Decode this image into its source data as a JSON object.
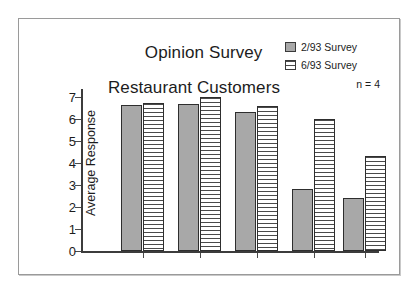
{
  "chart_data": {
    "type": "bar",
    "title": "Opinion Survey",
    "subtitle": "Restaurant Customers",
    "xlabel": "",
    "ylabel": "Average Response",
    "ylim": [
      0,
      7
    ],
    "yticks": [
      0,
      1,
      2,
      3,
      4,
      5,
      6,
      7
    ],
    "grid": false,
    "legend_position": "top-right",
    "annotation": "n = 4",
    "categories": [
      "Food",
      "Speed",
      "Friendly",
      "Servings",
      "Price"
    ],
    "series": [
      {
        "name": "2/93 Survey",
        "pattern": "stipple-gray",
        "color": "#a8a8a8",
        "values": [
          6.65,
          6.7,
          6.3,
          2.8,
          2.4
        ]
      },
      {
        "name": "6/93 Survey",
        "pattern": "horizontal-lines",
        "color": "#ffffff",
        "values": [
          6.75,
          7.0,
          6.6,
          6.0,
          4.3
        ]
      }
    ]
  },
  "chart": {
    "title_line1": "Opinion Survey",
    "title_line2": "Restaurant Customers",
    "y_axis_title": "Average Response",
    "sample_note": "n = 4",
    "y_tick_labels": [
      "7",
      "6",
      "5",
      "4",
      "3",
      "2",
      "1",
      "0"
    ],
    "x_tick_labels": [
      "Food",
      "Speed",
      "Friendly",
      "Servings",
      "Price"
    ],
    "legend": [
      {
        "label": "2/93 Survey"
      },
      {
        "label": "6/93 Survey"
      }
    ]
  }
}
